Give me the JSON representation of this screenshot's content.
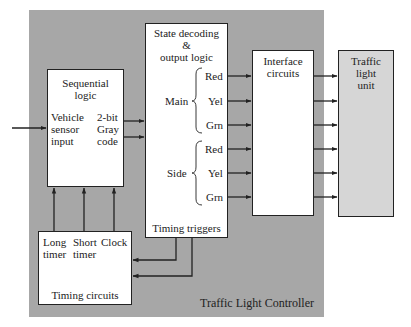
{
  "title": "Traffic Light Controller",
  "blocks": {
    "sequential_logic": {
      "title_line1": "Sequential",
      "title_line2": "logic",
      "input_line1": "Vehicle",
      "input_line2": "sensor",
      "input_line3": "input",
      "output_line1": "2-bit",
      "output_line2": "Gray",
      "output_line3": "code"
    },
    "state_decoding": {
      "title_line1": "State decoding",
      "title_line2": "&",
      "title_line3": "output logic",
      "main_label": "Main",
      "side_label": "Side",
      "signals": [
        "Red",
        "Yel",
        "Grn",
        "Red",
        "Yel",
        "Grn"
      ],
      "footer": "Timing triggers"
    },
    "interface": {
      "title_line1": "Interface",
      "title_line2": "circuits"
    },
    "traffic_light_unit": {
      "title_line1": "Traffic",
      "title_line2": "light",
      "title_line3": "unit"
    },
    "timing_circuits": {
      "col1_line1": "Long",
      "col1_line2": "timer",
      "col2_line1": "Short",
      "col2_line2": "timer",
      "col3_line1": "Clock",
      "footer": "Timing circuits"
    }
  },
  "colors": {
    "controller_bg": "#a7a7a7",
    "block_fill": "#ffffff",
    "traffic_unit_fill": "#d6d6d6",
    "line": "#222222"
  }
}
